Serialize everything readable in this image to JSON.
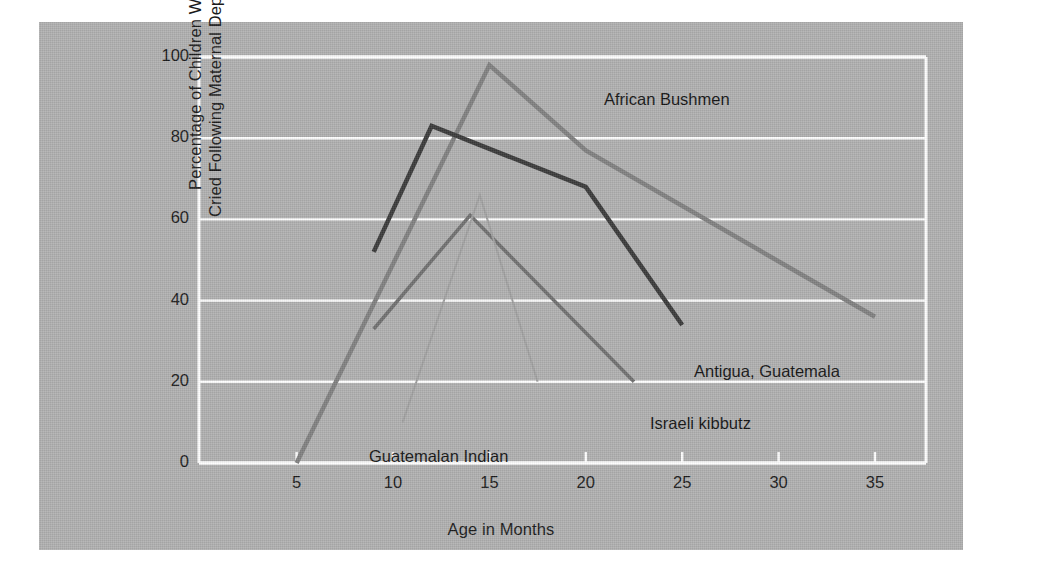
{
  "chart_data": {
    "type": "line",
    "title": "",
    "xlabel": "Age in Months",
    "ylabel": "Percentage of Children Who Cried Following Maternal Departure",
    "xlim": [
      3,
      37
    ],
    "ylim": [
      0,
      100
    ],
    "xticks": [
      5,
      10,
      15,
      20,
      25,
      30,
      35
    ],
    "yticks": [
      0,
      20,
      40,
      60,
      80,
      100
    ],
    "xtick_labels": [
      "5",
      "10",
      "15",
      "20",
      "25",
      "30",
      "35"
    ],
    "ytick_labels": [
      "0",
      "20",
      "40",
      "60",
      "80",
      "100"
    ],
    "grid": "horizontal-white",
    "legend": "inline-labels",
    "background_color": "#b0b0b0",
    "grid_color": "#ffffff",
    "series": [
      {
        "name": "African Bushmen",
        "color": "#808080",
        "width": 4.5,
        "label_x": 565,
        "label_y": 68,
        "x": [
          5,
          15,
          20,
          35
        ],
        "y": [
          0,
          98,
          77,
          36
        ]
      },
      {
        "name": "Antigua, Guatemala",
        "color": "#3a3a3a",
        "width": 4.5,
        "label_x": 655,
        "label_y": 340,
        "x": [
          9,
          12,
          20,
          25
        ],
        "y": [
          52,
          83,
          68,
          34
        ]
      },
      {
        "name": "Israeli kibbutz",
        "color": "#707070",
        "width": 3.5,
        "label_x": 611,
        "label_y": 392,
        "x": [
          9,
          14,
          22.5
        ],
        "y": [
          33,
          61,
          20
        ]
      },
      {
        "name": "Guatemalan Indian",
        "color": "#a0a0a0",
        "width": 2,
        "label_x": 330,
        "label_y": 425,
        "x": [
          10.5,
          14.5,
          17.5
        ],
        "y": [
          10,
          66,
          20
        ]
      }
    ]
  },
  "axis": {
    "x_title": "Age in Months",
    "y_title_line1": "Percentage of Children Who",
    "y_title_line2": "Cried Following Maternal Departure"
  }
}
